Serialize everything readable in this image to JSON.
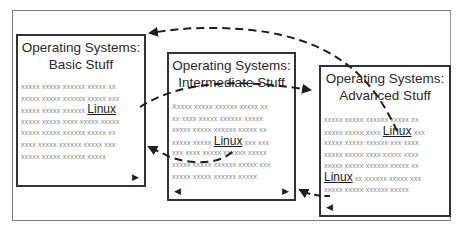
{
  "diagram": {
    "pages": [
      {
        "id": "basic",
        "title_line1": "Operating Systems:",
        "title_line2": "Basic Stuff",
        "lines": [
          {
            "pre": "xxxxx xxxxx xxxxxx xxxxx xx",
            "link": "",
            "post": ""
          },
          {
            "pre": "xxxxx xxxxx xxxxxx xxxxx xxx",
            "link": "",
            "post": ""
          },
          {
            "pre": "xxxxx xxxxx xxxxxx ",
            "link": "Linux",
            "post": ""
          },
          {
            "pre": "xxxxx xxxxx xxxx xxxxx xxxxx",
            "link": "",
            "post": ""
          },
          {
            "pre": "xxxxx xxxxx xxxxxx xxxxx  xx",
            "link": "",
            "post": ""
          },
          {
            "pre": "xxxx xxxxx xxxxxx xxxxx xxx",
            "link": "",
            "post": ""
          },
          {
            "pre": "xxxxx xxxxx xxxxxx xxxxx",
            "link": "",
            "post": ""
          }
        ],
        "next_glyph": "▶",
        "prev_glyph": ""
      },
      {
        "id": "intermediate",
        "title_line1": "Operating Systems:",
        "title_line2": "Intermediate Stuff",
        "lines": [
          {
            "pre": "Xxxxx xxxxx xxxxxx xxxxx xx",
            "link": "",
            "post": ""
          },
          {
            "pre": "xx xxxx xxxxx xxxxxx xxxxx",
            "link": "",
            "post": ""
          },
          {
            "pre": "xxxxx xxxxx xxxxxx xxxxx xx",
            "link": "",
            "post": ""
          },
          {
            "pre": "xxxxx xxxxx ",
            "link": "Linux",
            "post": " xxx xxx"
          },
          {
            "pre": "xxx xxxx xxxxx xxxxxx xxxxx",
            "link": "",
            "post": ""
          },
          {
            "pre": "xxxxx xxxxx xxxxxx xxxxx xxx",
            "link": "",
            "post": ""
          },
          {
            "pre": "xxxxx xxxxx xxxxxx xxxxx",
            "link": "",
            "post": ""
          }
        ],
        "next_glyph": "▶",
        "prev_glyph": "◀"
      },
      {
        "id": "advanced",
        "title_line1": "Operating Systems:",
        "title_line2": "Advanced Stuff",
        "lines": [
          {
            "pre": "xxxxx xxxxx xxxxxx xxxxx xx",
            "link": "",
            "post": ""
          },
          {
            "pre": "xxxxx xxxxx xxxx ",
            "link": "Linux",
            "post": " xxx"
          },
          {
            "pre": "xxxxx xxxxx xxxxxx xxx xxxx",
            "link": "",
            "post": ""
          },
          {
            "pre": "xxxxx xxxxx xxxx xxxxx xxxx",
            "link": "",
            "post": ""
          },
          {
            "pre": "xxxxx xxxxx xxxxxx xxxxx  xx",
            "link": "",
            "post": ""
          },
          {
            "pre": "",
            "link": "Linux",
            "post": " xx xxxxxx xxxxx xxx"
          },
          {
            "pre": "xxxxx xxxxx xxxxxx xxxxx",
            "link": "",
            "post": ""
          }
        ],
        "next_glyph": "",
        "prev_glyph": "◀"
      }
    ],
    "colors": {
      "border": "#333333",
      "frame": "#7a7a7a",
      "filler_text": "#8a8a8a",
      "title_text": "#2a2a2a",
      "arrow": "#1e1e1e"
    },
    "arrows": [
      {
        "from": "advanced-linux-link",
        "to": "basic-page",
        "style": "dashed-curve"
      },
      {
        "from": "basic-linux-link",
        "to": "advanced-page",
        "style": "dashed-curve"
      },
      {
        "from": "intermediate-linux-link",
        "to": "basic-page",
        "style": "dashed-curve"
      },
      {
        "from": "advanced-linux-link-2",
        "to": "intermediate-page",
        "style": "dashed-curve"
      }
    ]
  }
}
